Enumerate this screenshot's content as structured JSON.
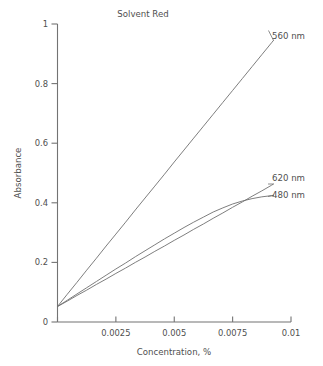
{
  "chart_data": {
    "type": "line",
    "title": "Solvent Red",
    "xlabel": "Concentration, %",
    "ylabel": "Absorbance",
    "xlim": [
      0,
      0.01
    ],
    "ylim": [
      0,
      1
    ],
    "xticks": [
      0,
      0.0025,
      0.005,
      0.0075,
      0.01
    ],
    "xticklabels": [
      "0",
      "0.0025",
      "0.005",
      "0.0075",
      "0.01"
    ],
    "yticks": [
      0,
      0.2,
      0.4,
      0.6,
      0.8,
      1
    ],
    "yticklabels": [
      "0",
      "0.2",
      "0.4",
      "0.6",
      "0.8",
      "1"
    ],
    "grid": false,
    "legend_position": "right-inline-annotations",
    "series": [
      {
        "name": "560 nm",
        "label": "560 nm",
        "color": "#6f6f6f",
        "x": [
          0.0,
          0.000417,
          0.000833,
          0.00125,
          0.001667,
          0.002083,
          0.0025,
          0.002917,
          0.003333,
          0.00375,
          0.004167,
          0.004583,
          0.005,
          0.005417,
          0.005833,
          0.00625,
          0.006667,
          0.007083,
          0.0075,
          0.007917,
          0.008333,
          0.00875,
          0.009167,
          0.00925
        ],
        "y": [
          0.052,
          0.093,
          0.133,
          0.174,
          0.214,
          0.255,
          0.295,
          0.335,
          0.376,
          0.416,
          0.456,
          0.496,
          0.537,
          0.577,
          0.617,
          0.657,
          0.697,
          0.737,
          0.777,
          0.817,
          0.857,
          0.897,
          0.937,
          0.945
        ]
      },
      {
        "name": "620 nm",
        "label": "620 nm",
        "color": "#6f6f6f",
        "x": [
          0.0,
          0.000417,
          0.000833,
          0.00125,
          0.001667,
          0.002083,
          0.0025,
          0.002917,
          0.003333,
          0.00375,
          0.004167,
          0.004583,
          0.005,
          0.005417,
          0.005833,
          0.00625,
          0.006667,
          0.007083,
          0.0075,
          0.007917,
          0.008333,
          0.00875,
          0.009167,
          0.00925
        ],
        "y": [
          0.052,
          0.07,
          0.089,
          0.107,
          0.126,
          0.144,
          0.163,
          0.181,
          0.2,
          0.218,
          0.237,
          0.255,
          0.274,
          0.292,
          0.311,
          0.329,
          0.348,
          0.366,
          0.385,
          0.403,
          0.422,
          0.44,
          0.459,
          0.463
        ]
      },
      {
        "name": "480 nm",
        "label": "480 nm",
        "color": "#6f6f6f",
        "x": [
          0.0,
          0.000417,
          0.000833,
          0.00125,
          0.001667,
          0.002083,
          0.0025,
          0.002917,
          0.003333,
          0.00375,
          0.004167,
          0.004583,
          0.005,
          0.005417,
          0.005833,
          0.00625,
          0.006667,
          0.007083,
          0.0075,
          0.007917,
          0.008333,
          0.00875,
          0.009167,
          0.00925
        ],
        "y": [
          0.052,
          0.073,
          0.094,
          0.115,
          0.136,
          0.157,
          0.178,
          0.198,
          0.219,
          0.239,
          0.259,
          0.279,
          0.298,
          0.317,
          0.335,
          0.352,
          0.369,
          0.383,
          0.396,
          0.406,
          0.414,
          0.42,
          0.424,
          0.425
        ]
      }
    ],
    "annotations": [
      {
        "text": "560 nm",
        "series": "560 nm"
      },
      {
        "text": "620 nm",
        "series": "620 nm"
      },
      {
        "text": "480 nm",
        "series": "480 nm"
      }
    ]
  }
}
